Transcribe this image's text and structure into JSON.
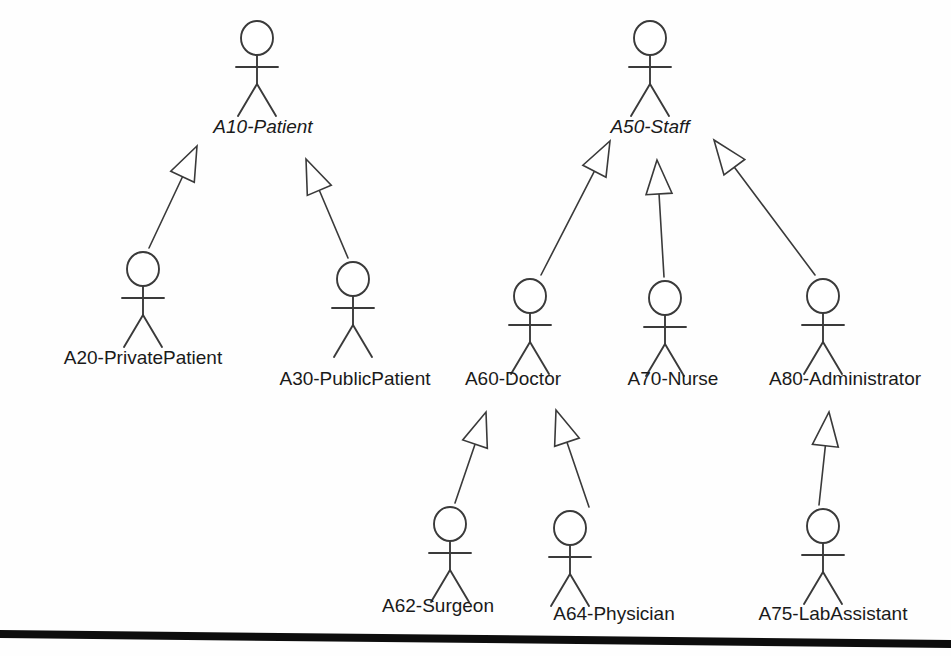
{
  "diagram": {
    "type": "uml-actor-generalization-hierarchy",
    "notation": "UML use-case actor generalization",
    "background_color": "#fefefe",
    "stroke_color": "#3a3a3a",
    "text_color": "#1a1a1a",
    "rule_color": "#0d0d0d"
  },
  "actors": [
    {
      "id": "a10",
      "label": "A10-Patient",
      "abstract": true,
      "figure_x": 257,
      "figure_top": 22,
      "label_x": 263,
      "label_y": 133
    },
    {
      "id": "a20",
      "label": "A20-PrivatePatient",
      "abstract": false,
      "figure_x": 143,
      "figure_top": 253,
      "label_x": 143,
      "label_y": 364
    },
    {
      "id": "a30",
      "label": "A30-PublicPatient",
      "abstract": false,
      "figure_x": 353,
      "figure_top": 263,
      "label_x": 355,
      "label_y": 385
    },
    {
      "id": "a50",
      "label": "A50-Staff",
      "abstract": true,
      "figure_x": 650,
      "figure_top": 22,
      "label_x": 650,
      "label_y": 133
    },
    {
      "id": "a60",
      "label": "A60-Doctor",
      "abstract": false,
      "figure_x": 530,
      "figure_top": 280,
      "label_x": 513,
      "label_y": 385
    },
    {
      "id": "a70",
      "label": "A70-Nurse",
      "abstract": false,
      "figure_x": 665,
      "figure_top": 282,
      "label_x": 673,
      "label_y": 385
    },
    {
      "id": "a80",
      "label": "A80-Administrator",
      "abstract": false,
      "figure_x": 823,
      "figure_top": 280,
      "label_x": 845,
      "label_y": 385
    },
    {
      "id": "a62",
      "label": "A62-Surgeon",
      "abstract": false,
      "figure_x": 450,
      "figure_top": 508,
      "label_x": 438,
      "label_y": 612
    },
    {
      "id": "a64",
      "label": "A64-Physician",
      "abstract": false,
      "figure_x": 570,
      "figure_top": 512,
      "label_x": 614,
      "label_y": 620
    },
    {
      "id": "a75",
      "label": "A75-LabAssistant",
      "abstract": false,
      "figure_x": 823,
      "figure_top": 510,
      "label_x": 833,
      "label_y": 620
    }
  ],
  "generalizations": [
    {
      "id": "g-a20-a10",
      "from": "A20-PrivatePatient",
      "to": "A10-Patient",
      "tail_x": 149,
      "tail_y": 248,
      "tip_x": 197,
      "tip_y": 146
    },
    {
      "id": "g-a30-a10",
      "from": "A30-PublicPatient",
      "to": "A10-Patient",
      "tail_x": 348,
      "tail_y": 258,
      "tip_x": 306,
      "tip_y": 159
    },
    {
      "id": "g-a60-a50",
      "from": "A60-Doctor",
      "to": "A50-Staff",
      "tail_x": 541,
      "tail_y": 275,
      "tip_x": 610,
      "tip_y": 141
    },
    {
      "id": "g-a70-a50",
      "from": "A70-Nurse",
      "to": "A50-Staff",
      "tail_x": 664,
      "tail_y": 277,
      "tip_x": 657,
      "tip_y": 160
    },
    {
      "id": "g-a80-a50",
      "from": "A80-Administrator",
      "to": "A50-Staff",
      "tail_x": 815,
      "tail_y": 275,
      "tip_x": 714,
      "tip_y": 140
    },
    {
      "id": "g-a62-a60",
      "from": "A62-Surgeon",
      "to": "A60-Doctor",
      "tail_x": 455,
      "tail_y": 503,
      "tip_x": 486,
      "tip_y": 412
    },
    {
      "id": "g-a64-a60",
      "from": "A64-Physician",
      "to": "A60-Doctor",
      "tail_x": 589,
      "tail_y": 507,
      "tip_x": 556,
      "tip_y": 410
    },
    {
      "id": "g-a75-a80",
      "from": "A75-LabAssistant",
      "to": "A80-Administrator",
      "tail_x": 819,
      "tail_y": 505,
      "tip_x": 829,
      "tip_y": 412
    }
  ],
  "bottom_rule": {
    "name": "page-bottom-rule",
    "left_y": 630,
    "right_y": 640,
    "thickness": 8
  }
}
